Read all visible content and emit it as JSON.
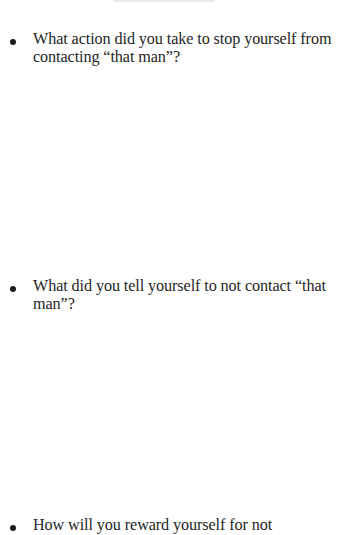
{
  "document": {
    "questions": [
      {
        "bullet": "•",
        "text": "What action did you take  to stop yourself from contacting  “that man”?"
      },
      {
        "bullet": "•",
        "text": "What did you tell yourself  to not contact “that man”?"
      },
      {
        "bullet": "•",
        "text": "How will you reward yourself  for not"
      }
    ]
  }
}
